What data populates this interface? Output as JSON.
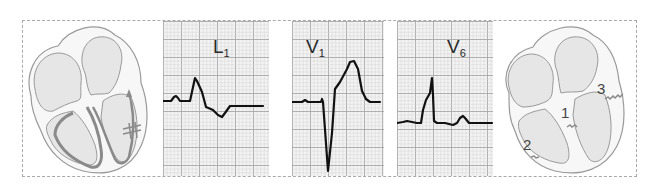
{
  "figure": {
    "colors": {
      "background": "#ffffff",
      "frame_border": "#a9a9a9",
      "grid_minor": "#d4d4d4",
      "grid_major": "#a8a8a8",
      "grid_bg": "#f3f3f3",
      "trace": "#111111",
      "heart_fill": "#e8e8e8",
      "heart_wall": "#f7f7f7",
      "heart_outline": "#9a9a9a",
      "conduction": "#8a8a8a"
    },
    "left_heart": {
      "description": "Heart diagram showing conduction through left bundle branch with block marks",
      "block_mark": "double-hatch"
    },
    "ecg_leads": [
      {
        "id": "L1",
        "label_main": "L",
        "label_sub": "1",
        "trace": [
          [
            0,
            80
          ],
          [
            8,
            80
          ],
          [
            11,
            76
          ],
          [
            13,
            75
          ],
          [
            15,
            77
          ],
          [
            17,
            80
          ],
          [
            27,
            80
          ],
          [
            32,
            57
          ],
          [
            34,
            60
          ],
          [
            39,
            71
          ],
          [
            43,
            86
          ],
          [
            50,
            89
          ],
          [
            55,
            94
          ],
          [
            59,
            96
          ],
          [
            62,
            92
          ],
          [
            67,
            85
          ],
          [
            100,
            85
          ]
        ]
      },
      {
        "id": "V1",
        "label_main": "V",
        "label_sub": "1",
        "trace": [
          [
            0,
            81
          ],
          [
            10,
            81
          ],
          [
            13,
            79
          ],
          [
            16,
            81
          ],
          [
            29,
            81
          ],
          [
            30,
            78
          ],
          [
            31,
            81
          ],
          [
            36,
            150
          ],
          [
            40,
            112
          ],
          [
            43,
            68
          ],
          [
            48,
            61
          ],
          [
            55,
            48
          ],
          [
            58,
            41
          ],
          [
            62,
            40
          ],
          [
            66,
            48
          ],
          [
            70,
            70
          ],
          [
            74,
            78
          ],
          [
            78,
            81
          ],
          [
            88,
            81
          ]
        ]
      },
      {
        "id": "V6",
        "label_main": "V",
        "label_sub": "6",
        "trace": [
          [
            0,
            102
          ],
          [
            6,
            101
          ],
          [
            10,
            100
          ],
          [
            15,
            101
          ],
          [
            20,
            102
          ],
          [
            24,
            102
          ],
          [
            26,
            89
          ],
          [
            29,
            79
          ],
          [
            33,
            72
          ],
          [
            35,
            57
          ],
          [
            36,
            74
          ],
          [
            37,
            100
          ],
          [
            40,
            102
          ],
          [
            48,
            102
          ],
          [
            56,
            104
          ],
          [
            60,
            102
          ],
          [
            63,
            97
          ],
          [
            66,
            95
          ],
          [
            68,
            97
          ],
          [
            72,
            102
          ],
          [
            95,
            102
          ]
        ]
      }
    ],
    "right_heart": {
      "description": "Heart diagram with numbered activation sites",
      "markers": [
        {
          "number": "1"
        },
        {
          "number": "2"
        },
        {
          "number": "3"
        }
      ]
    }
  }
}
